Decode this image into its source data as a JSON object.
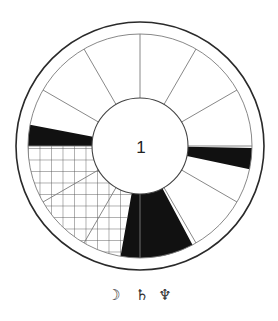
{
  "diagram": {
    "type": "astrological-house-wheel",
    "center": {
      "x": 140,
      "y": 146
    },
    "outer_radius": 124,
    "ring_radius": 112,
    "inner_radius": 48,
    "spoke_count": 12,
    "spoke_start_deg": 0,
    "center_label": "1",
    "colors": {
      "outer_stroke": "#2a2a2a",
      "line_stroke": "#7a7a7a",
      "fill_black": "#111111",
      "hatch": "#555555",
      "background": "#ffffff"
    },
    "wedges": [
      {
        "name": "right-black-wedge",
        "style": "black",
        "start_deg": 1,
        "end_deg": 12
      },
      {
        "name": "bottom-black-wedge",
        "style": "black",
        "start_deg": 62,
        "end_deg": 100
      },
      {
        "name": "lower-left-hatched-wedge",
        "style": "hatch",
        "start_deg": 100,
        "end_deg": 180
      },
      {
        "name": "left-black-wedge",
        "style": "black",
        "start_deg": 180,
        "end_deg": 191
      }
    ],
    "hatch_spacing": 11.5
  },
  "symbols": [
    {
      "name": "moon-icon",
      "glyph": "☽",
      "x": 114
    },
    {
      "name": "saturn-icon",
      "glyph": "♄",
      "x": 142
    },
    {
      "name": "neptune-icon",
      "glyph": "♆",
      "x": 165
    }
  ]
}
